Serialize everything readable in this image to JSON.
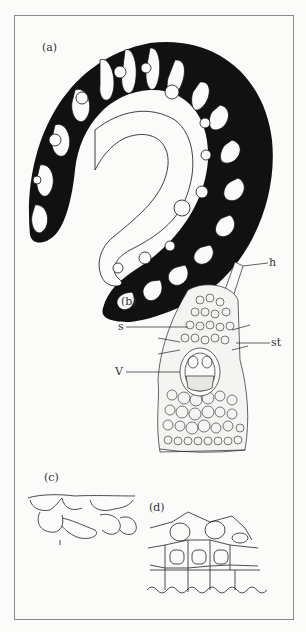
{
  "figure": {
    "panels": [
      {
        "id": "a",
        "label": "(a)",
        "description": "transverse section of curled leaf, black outline with white folded grooves and hairs"
      },
      {
        "id": "b",
        "label": "(b)",
        "description": "enlarged cross-section of a leaf rib with vascular bundle"
      },
      {
        "id": "c",
        "label": "(c)",
        "description": "epidermal cells detail"
      },
      {
        "id": "d",
        "label": "(d)",
        "description": "cell layer detail"
      }
    ],
    "annotations": [
      {
        "key": "h",
        "label": "h"
      },
      {
        "key": "s",
        "label": "s"
      },
      {
        "key": "st",
        "label": "st"
      },
      {
        "key": "V",
        "label": "V"
      }
    ]
  }
}
